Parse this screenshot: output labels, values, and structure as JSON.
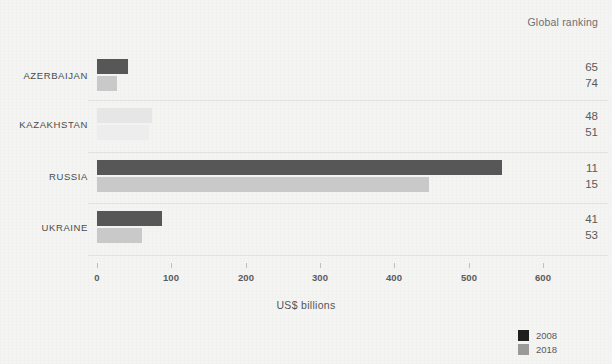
{
  "header": {
    "ranking_title": "Global ranking"
  },
  "axis": {
    "title": "US$ billions",
    "ticks": [
      "0",
      "100",
      "200",
      "300",
      "400",
      "500",
      "600"
    ]
  },
  "legend": [
    {
      "label": "2008",
      "color": "#1f1f1f"
    },
    {
      "label": "2018",
      "color": "#9a9a9a"
    }
  ],
  "colors": {
    "series_2008": "#575757",
    "series_2018": "#c9c9c9",
    "background": "#f4f4f3",
    "separator": "#e2e2e2",
    "text": "#5a5a5a"
  },
  "rows": [
    {
      "label": "AZERBAIJAN",
      "rank_2008": "65",
      "rank_2018": "74"
    },
    {
      "label": "KAZAKHSTAN",
      "rank_2008": "48",
      "rank_2018": "51"
    },
    {
      "label": "RUSSIA",
      "rank_2008": "11",
      "rank_2018": "15"
    },
    {
      "label": "UKRAINE",
      "rank_2008": "41",
      "rank_2018": "53"
    }
  ],
  "chart_data": {
    "type": "bar",
    "orientation": "horizontal",
    "title": "",
    "xlabel": "US$ billions",
    "ylabel": "",
    "xlim": [
      0,
      640
    ],
    "grid": false,
    "legend_position": "bottom-right",
    "categories": [
      "AZERBAIJAN",
      "KAZAKHSTAN",
      "RUSSIA",
      "UKRAINE"
    ],
    "series": [
      {
        "name": "2008",
        "values": [
          42,
          74,
          545,
          88
        ]
      },
      {
        "name": "2018",
        "values": [
          27,
          70,
          447,
          60
        ]
      }
    ],
    "annotations": {
      "column_title": "Global ranking",
      "global_ranking_2008": [
        65,
        48,
        11,
        41
      ],
      "global_ranking_2018": [
        74,
        51,
        15,
        53
      ]
    },
    "xticks": [
      0,
      100,
      200,
      300,
      400,
      500,
      600
    ]
  }
}
